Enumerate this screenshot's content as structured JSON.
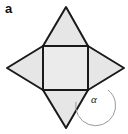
{
  "figure": {
    "panel_label": "a",
    "angle_label": "α",
    "colors": {
      "square_fill": "#ebebeb",
      "triangle_fill": "#e6e6e6",
      "stroke": "#1a1a1a",
      "arc_stroke": "#9a9a9a",
      "background": "#ffffff",
      "label_text": "#111111"
    },
    "geometry": {
      "square": {
        "top_left": [
          43,
          46
        ],
        "top_right": [
          88,
          46
        ],
        "bottom_right": [
          88,
          90
        ],
        "bottom_left": [
          43,
          90
        ]
      },
      "apexes": {
        "top": [
          66,
          7
        ],
        "right": [
          124,
          68
        ],
        "bottom": [
          66,
          128
        ],
        "left": [
          7,
          68
        ]
      },
      "angle_arc": {
        "vertex": [
          88,
          90
        ],
        "radius": 20
      },
      "stroke_width": 2,
      "arc_stroke_width": 1
    },
    "shape_names": [
      "center-square",
      "triangle-top",
      "triangle-right",
      "triangle-bottom",
      "triangle-left"
    ]
  }
}
